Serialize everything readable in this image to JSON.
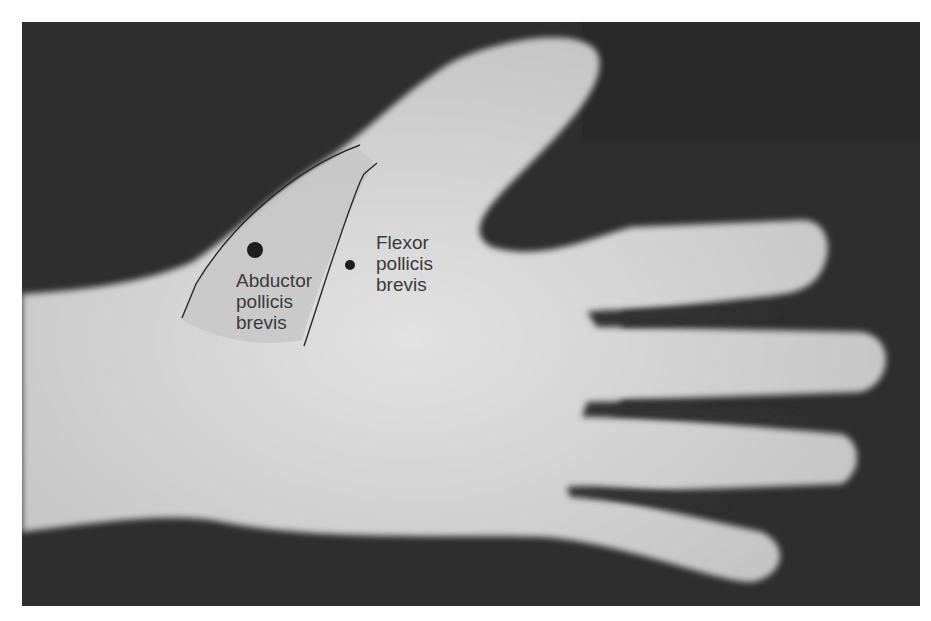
{
  "figure": {
    "labels": {
      "abductor": [
        "Abductor",
        "pollicis",
        "brevis"
      ],
      "flexor": [
        "Flexor",
        "pollicis",
        "brevis"
      ]
    },
    "markers": [
      {
        "name": "abductor-pollicis-brevis-point",
        "size": "large"
      },
      {
        "name": "flexor-pollicis-brevis-point",
        "size": "small"
      }
    ],
    "colors": {
      "background": "#303030",
      "skin": "#d4d4d4",
      "outline": "#2a2a2a",
      "marker": "#1e1e1e",
      "text": "#3a3a3a"
    }
  }
}
